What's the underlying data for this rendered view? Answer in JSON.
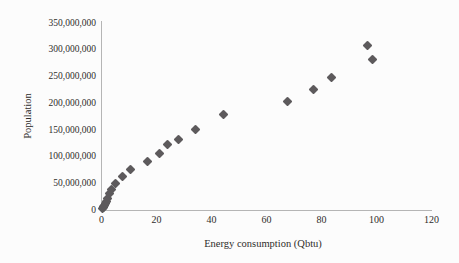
{
  "figure": {
    "background": "#fcfcfc"
  },
  "chart_data": {
    "type": "scatter",
    "title": "",
    "xlabel": "Energy consumption (Qbtu)",
    "ylabel": "Population",
    "xlim": [
      0,
      120
    ],
    "ylim": [
      0,
      350000000
    ],
    "grid": false,
    "legend": null,
    "marker": {
      "shape": "diamond",
      "color": "#5d5a5c",
      "size_px": 7
    },
    "axis_color": "#b5b5b5",
    "text_color": "#2f2d2b",
    "x_ticks": [
      {
        "value": 0,
        "label": "0"
      },
      {
        "value": 20,
        "label": "20"
      },
      {
        "value": 40,
        "label": "40"
      },
      {
        "value": 60,
        "label": "60"
      },
      {
        "value": 80,
        "label": "80"
      },
      {
        "value": 100,
        "label": "100"
      },
      {
        "value": 120,
        "label": "120"
      }
    ],
    "y_ticks": [
      {
        "value": 0,
        "label": "0"
      },
      {
        "value": 50000000,
        "label": "50,000,000"
      },
      {
        "value": 100000000,
        "label": "100,000,000"
      },
      {
        "value": 150000000,
        "label": "150,000,000"
      },
      {
        "value": 200000000,
        "label": "200,000,000"
      },
      {
        "value": 250000000,
        "label": "250,000,000"
      },
      {
        "value": 300000000,
        "label": "300,000,000"
      },
      {
        "value": 350000000,
        "label": "350,000,000"
      }
    ],
    "points": [
      [
        0.35,
        3900000
      ],
      [
        0.55,
        5300000
      ],
      [
        0.75,
        7200000
      ],
      [
        1.0,
        9600000
      ],
      [
        1.3,
        12900000
      ],
      [
        1.7,
        17100000
      ],
      [
        2.3,
        23200000
      ],
      [
        3.0,
        31400000
      ],
      [
        3.8,
        38600000
      ],
      [
        5.0,
        50200000
      ],
      [
        7.5,
        63000000
      ],
      [
        10.5,
        76200000
      ],
      [
        16.6,
        92200000
      ],
      [
        21.0,
        106000000
      ],
      [
        24.0,
        123200000
      ],
      [
        28.0,
        132200000
      ],
      [
        34.0,
        151300000
      ],
      [
        44.5,
        179300000
      ],
      [
        67.5,
        203300000
      ],
      [
        77.2,
        226500000
      ],
      [
        83.7,
        248700000
      ],
      [
        96.8,
        308700000
      ],
      [
        98.4,
        281400000
      ]
    ]
  }
}
